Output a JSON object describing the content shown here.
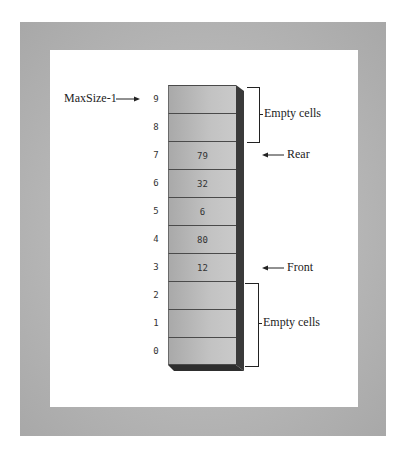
{
  "diagram": {
    "type": "array-queue",
    "cells": [
      {
        "index": "9",
        "value": ""
      },
      {
        "index": "8",
        "value": ""
      },
      {
        "index": "7",
        "value": "79"
      },
      {
        "index": "6",
        "value": "32"
      },
      {
        "index": "5",
        "value": "6"
      },
      {
        "index": "4",
        "value": "80"
      },
      {
        "index": "3",
        "value": "12"
      },
      {
        "index": "2",
        "value": ""
      },
      {
        "index": "1",
        "value": ""
      },
      {
        "index": "0",
        "value": ""
      }
    ],
    "labels": {
      "max_size": "MaxSize-1",
      "rear": "Rear",
      "front": "Front",
      "empty_top": "Empty cells",
      "empty_bottom": "Empty cells"
    },
    "colors": {
      "frame": "#b8b8b8",
      "cell": "#c0c0c0",
      "cell_border": "#4a4a4a",
      "side_face": "#3a3a3a"
    }
  }
}
